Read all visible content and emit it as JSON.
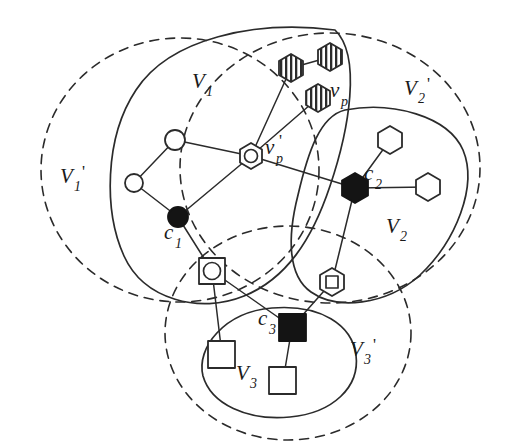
{
  "figure": {
    "background_color": "#ffffff",
    "stroke_color": "#2b2b2b",
    "fill_dark": "#141414"
  },
  "regions": [
    {
      "id": "V1p",
      "label_base": "V",
      "label_sub": "1",
      "label_prime": "'",
      "style": "dashed",
      "label_x": 64,
      "label_y": 180
    },
    {
      "id": "V2p",
      "label_base": "V",
      "label_sub": "2",
      "label_prime": "'",
      "style": "dashed",
      "label_x": 409,
      "label_y": 95
    },
    {
      "id": "V3p",
      "label_base": "V",
      "label_sub": "3",
      "label_prime": "'",
      "style": "dashed",
      "label_x": 355,
      "label_y": 355
    },
    {
      "id": "V1",
      "label_base": "V",
      "label_sub": "1",
      "label_prime": "",
      "style": "solid",
      "label_x": 196,
      "label_y": 86
    },
    {
      "id": "V2",
      "label_base": "V",
      "label_sub": "2",
      "label_prime": "",
      "style": "solid",
      "label_x": 390,
      "label_y": 232
    },
    {
      "id": "V3",
      "label_base": "V",
      "label_sub": "3",
      "label_prime": "",
      "style": "solid",
      "label_x": 240,
      "label_y": 379
    }
  ],
  "node_labels": [
    {
      "id": "c1",
      "base": "c",
      "sub": "1",
      "prime": "",
      "x": 170,
      "y": 237
    },
    {
      "id": "c2",
      "base": "c",
      "sub": "2",
      "prime": "",
      "x": 369,
      "y": 178
    },
    {
      "id": "c3",
      "base": "c",
      "sub": "3",
      "prime": "",
      "x": 264,
      "y": 323
    },
    {
      "id": "vp",
      "base": "v",
      "sub": "p",
      "prime": "",
      "x": 333,
      "y": 96
    },
    {
      "id": "vpprime",
      "base": "v",
      "sub": "p",
      "prime": "'",
      "x": 268,
      "y": 152
    }
  ],
  "nodes": [
    {
      "id": "n_circle_top",
      "shape": "circle",
      "fill": "open",
      "x": 175,
      "y": 140,
      "r": 10
    },
    {
      "id": "n_circle_left",
      "shape": "circle",
      "fill": "open",
      "x": 134,
      "y": 183,
      "r": 9
    },
    {
      "id": "c1",
      "shape": "circle",
      "fill": "filled",
      "x": 178,
      "y": 217,
      "r": 10
    },
    {
      "id": "vp_prime",
      "shape": "hex-in-circle",
      "fill": "open",
      "x": 251,
      "y": 156,
      "r": 13
    },
    {
      "id": "c2",
      "shape": "hexagon",
      "fill": "filled",
      "x": 355,
      "y": 188,
      "r": 15
    },
    {
      "id": "n_hex_upper",
      "shape": "hexagon",
      "fill": "open",
      "x": 390,
      "y": 140,
      "r": 14
    },
    {
      "id": "n_hex_right",
      "shape": "hexagon",
      "fill": "open",
      "x": 428,
      "y": 187,
      "r": 14
    },
    {
      "id": "n_hatch_left",
      "shape": "hexagon-hatched",
      "fill": "hatched",
      "x": 291,
      "y": 68,
      "r": 14
    },
    {
      "id": "n_hatch_right",
      "shape": "hexagon-hatched",
      "fill": "hatched",
      "x": 330,
      "y": 57,
      "r": 14
    },
    {
      "id": "vp",
      "shape": "hexagon-hatched",
      "fill": "hatched",
      "x": 318,
      "y": 98,
      "r": 14
    },
    {
      "id": "n_circ_in_sq",
      "shape": "circle-in-square",
      "fill": "open",
      "x": 212,
      "y": 271,
      "r": 13
    },
    {
      "id": "n_sq_in_hex",
      "shape": "square-in-hexagon",
      "fill": "open",
      "x": 332,
      "y": 282,
      "r": 14
    },
    {
      "id": "c3",
      "shape": "square",
      "fill": "filled",
      "x": 292,
      "y": 327,
      "r": 13
    },
    {
      "id": "n_sq_left",
      "shape": "square",
      "fill": "open",
      "x": 222,
      "y": 355,
      "r": 13
    },
    {
      "id": "n_sq_bottom",
      "shape": "square",
      "fill": "open",
      "x": 283,
      "y": 381,
      "r": 13
    }
  ],
  "edges": [
    {
      "from": "n_circle_top",
      "to": "n_circle_left"
    },
    {
      "from": "n_circle_left",
      "to": "c1"
    },
    {
      "from": "n_circle_top",
      "to": "vp_prime"
    },
    {
      "from": "c1",
      "to": "vp_prime"
    },
    {
      "from": "vp_prime",
      "to": "c2"
    },
    {
      "from": "vp_prime",
      "to": "n_hatch_left"
    },
    {
      "from": "vp_prime",
      "to": "vp"
    },
    {
      "from": "n_hatch_left",
      "to": "n_hatch_right"
    },
    {
      "from": "c2",
      "to": "n_hex_upper"
    },
    {
      "from": "c2",
      "to": "n_hex_right"
    },
    {
      "from": "c2",
      "to": "n_sq_in_hex"
    },
    {
      "from": "c1",
      "to": "n_circ_in_sq"
    },
    {
      "from": "n_circ_in_sq",
      "to": "n_sq_left"
    },
    {
      "from": "n_circ_in_sq",
      "to": "c3"
    },
    {
      "from": "c3",
      "to": "n_sq_bottom"
    },
    {
      "from": "n_sq_in_hex",
      "to": "c3"
    }
  ]
}
